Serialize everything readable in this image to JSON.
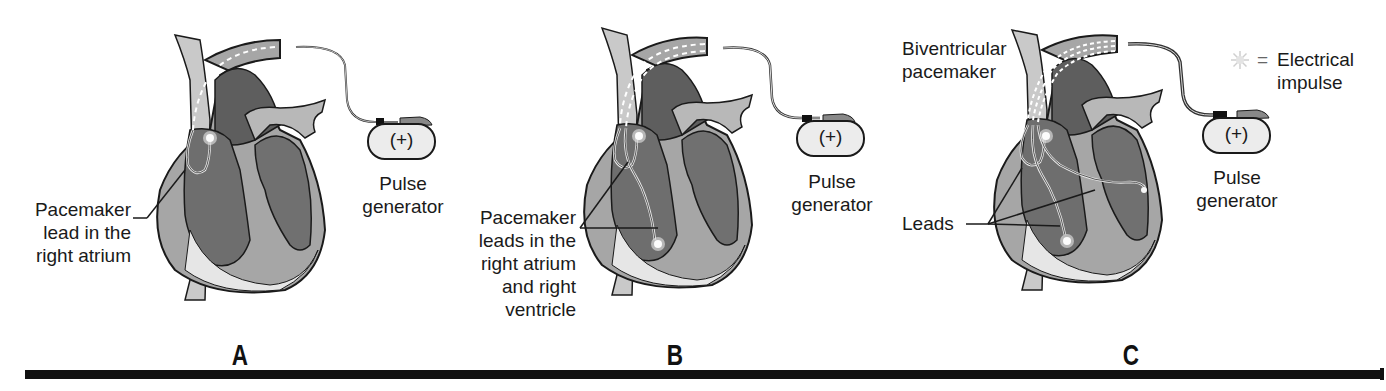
{
  "figure": {
    "colors": {
      "heart_dark": "#5e5e5e",
      "heart_mid": "#8a8a8a",
      "heart_light": "#c9c9c9",
      "heart_pale": "#e6e6e6",
      "outline": "#1a1a1a",
      "impulse": "#f4f4f4",
      "rule": "#111111"
    },
    "panels": [
      {
        "id": "A",
        "letter": "A",
        "lead_label": [
          "Pacemaker",
          "lead in the",
          "right atrium"
        ],
        "generator_symbol": "(+)",
        "generator_label": [
          "Pulse",
          "generator"
        ],
        "lead_count": 1
      },
      {
        "id": "B",
        "letter": "B",
        "lead_label": [
          "Pacemaker",
          "leads in the",
          "right atrium",
          "and right",
          "ventricle"
        ],
        "generator_symbol": "(+)",
        "generator_label": [
          "Pulse",
          "generator"
        ],
        "lead_count": 2
      },
      {
        "id": "C",
        "letter": "C",
        "title_label": [
          "Biventricular",
          "pacemaker"
        ],
        "lead_label": [
          "Leads"
        ],
        "generator_symbol": "(+)",
        "generator_label": [
          "Pulse",
          "generator"
        ],
        "lead_count": 3
      }
    ],
    "legend": {
      "icon": "electrical-impulse-star",
      "equals": "=",
      "text": [
        "Electrical",
        "impulse"
      ]
    }
  }
}
